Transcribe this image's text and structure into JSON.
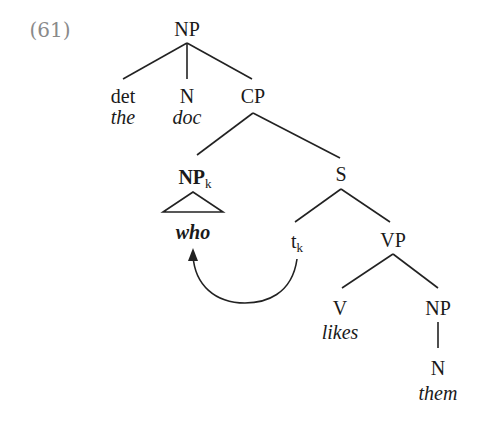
{
  "example_number": "(61)",
  "tree": {
    "root": "NP",
    "det": {
      "label": "det",
      "word": "the"
    },
    "n": {
      "label": "N",
      "word": "doc"
    },
    "cp": "CP",
    "np_k": {
      "label": "NP",
      "index": "k",
      "word": "who"
    },
    "s": "S",
    "trace": {
      "label": "t",
      "index": "k"
    },
    "vp": "VP",
    "v": {
      "label": "V",
      "word": "likes"
    },
    "np_obj": "NP",
    "n_obj": {
      "label": "N",
      "word": "them"
    }
  },
  "movement_arrow": {
    "from": "t_k",
    "to": "who"
  }
}
